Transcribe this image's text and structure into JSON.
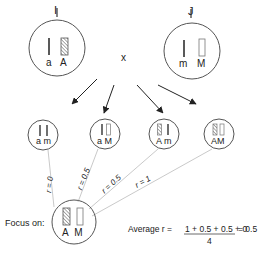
{
  "parents": [
    {
      "id": "I",
      "label": "I",
      "alleles": [
        "a",
        "A"
      ]
    },
    {
      "id": "J",
      "label": "J",
      "alleles": [
        "m",
        "M"
      ]
    }
  ],
  "cross_symbol": "x",
  "offspring": [
    {
      "alleles": [
        "a",
        "m"
      ],
      "r_label": "r = 0"
    },
    {
      "alleles": [
        "a",
        "M"
      ],
      "r_label": "r = 0.5"
    },
    {
      "alleles": [
        "A",
        "m"
      ],
      "r_label": "r = 0.5"
    },
    {
      "alleles": [
        "A",
        "M"
      ],
      "r_label": "r = 1"
    }
  ],
  "focus": {
    "label": "Focus on:",
    "alleles": [
      "A",
      "M"
    ]
  },
  "average": {
    "prefix": "Average r =",
    "numerator": "1 + 0.5 + 0.5 + 0",
    "denominator": "4",
    "result": "= 0.5"
  }
}
